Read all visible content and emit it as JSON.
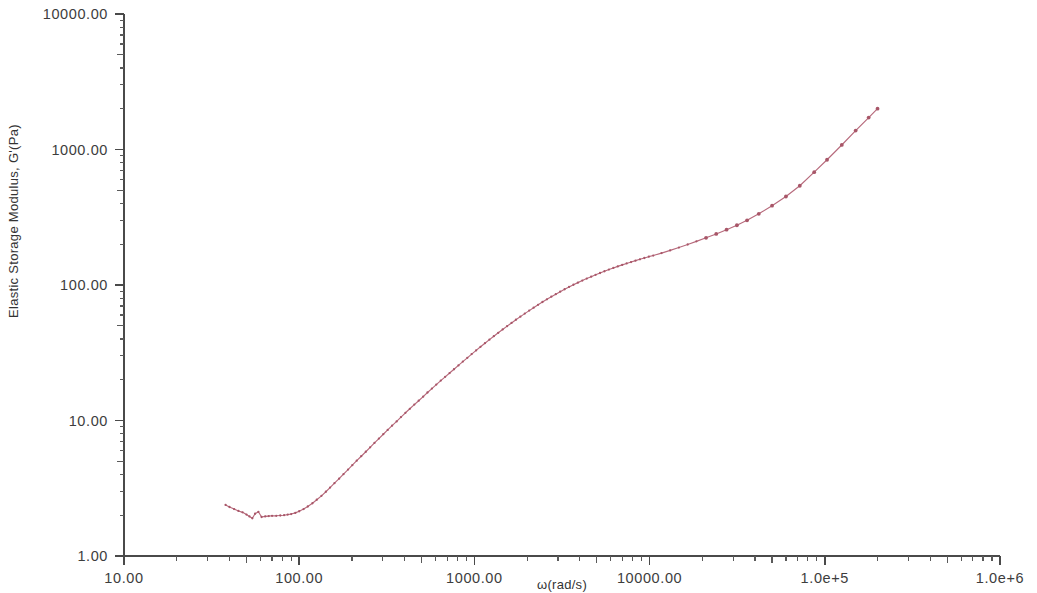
{
  "chart_data": {
    "type": "line",
    "title": "",
    "subtitle": "",
    "xlabel": "ω(rad/s)",
    "ylabel": "Elastic Storage Modulus, G'(Pa)",
    "xscale": "log",
    "yscale": "log",
    "xlim": [
      10,
      1000000
    ],
    "ylim": [
      1,
      10000
    ],
    "grid": false,
    "legend": null,
    "legend_position": "none",
    "x_tick_labels": [
      "10.00",
      "100.00",
      "1000.00",
      "10000.00",
      "1.0e+5",
      "1.0e+6"
    ],
    "x_tick_values": [
      10,
      100,
      1000,
      10000,
      100000,
      1000000
    ],
    "y_tick_labels": [
      "1.00",
      "10.00",
      "100.00",
      "1000.00",
      "10000.00"
    ],
    "y_tick_values": [
      1,
      10,
      100,
      1000,
      10000
    ],
    "series": [
      {
        "name": "G'",
        "color": "#b76a7c",
        "marker": "dot",
        "x": [
          38.0,
          40.0,
          42.5,
          45.0,
          47.5,
          50.0,
          52.0,
          54.0,
          56.0,
          58.5,
          61.0,
          64.0,
          67.0,
          70.0,
          74.0,
          78.0,
          82.0,
          86.0,
          90.0,
          95.0,
          100.0,
          106.0,
          112.0,
          119.0,
          126.0,
          134.0,
          142.0,
          150.0,
          159.0,
          169.0,
          179.0,
          190.0,
          201.0,
          213.0,
          226.0,
          240.0,
          254.0,
          269.0,
          285.0,
          302.0,
          320.0,
          339.0,
          360.0,
          381.0,
          404.0,
          428.0,
          454.0,
          481.0,
          510.0,
          540.0,
          572.0,
          606.0,
          643.0,
          681.0,
          722.0,
          765.0,
          811.0,
          859.0,
          911.0,
          965.0,
          1023.0,
          1084.0,
          1149.0,
          1218.0,
          1291.0,
          1368.0,
          1450.0,
          1537.0,
          1629.0,
          1726.0,
          1830.0,
          1939.0,
          2055.0,
          2178.0,
          2309.0,
          2447.0,
          2594.0,
          2749.0,
          2914.0,
          3088.0,
          3273.0,
          3469.0,
          3677.0,
          3897.0,
          4131.0,
          4379.0,
          4641.0,
          4920.0,
          5215.0,
          5527.0,
          5859.0,
          6210.0,
          6583.0,
          6977.0,
          7396.0,
          7839.0,
          8309.0,
          8808.0,
          9336.0,
          9896.0,
          10490.0,
          11700.0,
          13100.0,
          14700.0,
          16500.0,
          18500.0,
          21000.0,
          24000.0,
          27500.0,
          31500.0,
          36000.0,
          42000.0,
          50000.0,
          60000.0,
          72000.0,
          87000.0,
          103000.0,
          125000.0,
          150000.0,
          178000.0,
          200000.0
        ],
        "y": [
          2.38,
          2.3,
          2.22,
          2.15,
          2.1,
          2.02,
          1.96,
          1.9,
          2.05,
          2.12,
          1.94,
          1.96,
          1.97,
          1.98,
          1.98,
          1.99,
          2.0,
          2.02,
          2.04,
          2.08,
          2.14,
          2.22,
          2.32,
          2.45,
          2.6,
          2.78,
          2.98,
          3.2,
          3.45,
          3.72,
          4.02,
          4.34,
          4.68,
          5.05,
          5.45,
          5.88,
          6.34,
          6.83,
          7.36,
          7.92,
          8.52,
          9.16,
          9.85,
          10.6,
          11.4,
          12.2,
          13.1,
          14.0,
          15.0,
          16.1,
          17.2,
          18.4,
          19.7,
          21.0,
          22.4,
          23.9,
          25.5,
          27.2,
          29.0,
          30.9,
          32.9,
          35.0,
          37.2,
          39.5,
          41.9,
          44.4,
          47.0,
          49.7,
          52.5,
          55.4,
          58.4,
          61.5,
          64.7,
          68.0,
          71.4,
          74.9,
          78.4,
          82.0,
          85.6,
          89.3,
          93.0,
          96.7,
          100.4,
          104.1,
          107.8,
          111.5,
          115.2,
          118.9,
          122.6,
          126.3,
          130.0,
          133.6,
          137.2,
          140.7,
          144.2,
          147.7,
          151.2,
          154.7,
          158.2,
          161.8,
          165.0,
          172.0,
          180.0,
          189.0,
          199.0,
          210.0,
          223.0,
          238.0,
          256.0,
          276.0,
          300.0,
          335.0,
          385.0,
          450.0,
          540.0,
          680.0,
          840.0,
          1080.0,
          1380.0,
          1720.0,
          2000.0
        ]
      }
    ]
  },
  "axes": {
    "y_axis_name": "y-axis",
    "x_axis_name": "x-axis"
  }
}
